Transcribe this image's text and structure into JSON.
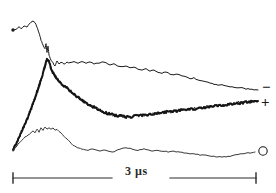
{
  "figure": {
    "background_color": "#ffffff",
    "ink_color": "#1a1a1a",
    "width": 276,
    "height": 193
  },
  "scalebar": {
    "label": "3 µs",
    "value": 3,
    "unit": "µs",
    "x_start": 13,
    "x_end": 256,
    "y": 178,
    "gap_start": 112,
    "gap_end": 170
  },
  "series_labels": {
    "minus": "−",
    "plus": "+",
    "zero": "O"
  },
  "chart_data": {
    "type": "line",
    "title": "",
    "subtitle": "",
    "xlabel": "3 µs",
    "ylabel": "",
    "grid": false,
    "legend_position": "right-inline",
    "axis_note": "no numeric axes drawn; horizontal scale bar denotes 3 microseconds",
    "xlim": [
      0,
      276
    ],
    "ylim": [
      193,
      0
    ],
    "series": [
      {
        "name": "−",
        "label": "minus",
        "stroke": "#1a1a1a",
        "stroke_width": 1,
        "noisy": false,
        "marker_start": "dot",
        "points": [
          [
            13,
            30
          ],
          [
            16,
            29
          ],
          [
            19,
            27
          ],
          [
            21,
            29
          ],
          [
            24,
            26
          ],
          [
            27,
            27
          ],
          [
            29,
            24
          ],
          [
            31,
            22
          ],
          [
            33,
            21
          ],
          [
            35,
            23
          ],
          [
            37,
            27
          ],
          [
            39,
            33
          ],
          [
            41,
            40
          ],
          [
            43,
            45
          ],
          [
            45,
            49
          ],
          [
            46,
            44
          ],
          [
            47,
            52
          ],
          [
            48,
            46
          ],
          [
            49,
            55
          ],
          [
            51,
            60
          ],
          [
            53,
            63
          ],
          [
            55,
            66
          ],
          [
            57,
            61
          ],
          [
            59,
            64
          ],
          [
            61,
            62
          ],
          [
            64,
            64
          ],
          [
            67,
            62
          ],
          [
            70,
            63
          ],
          [
            74,
            62
          ],
          [
            78,
            63
          ],
          [
            82,
            62
          ],
          [
            86,
            63
          ],
          [
            90,
            62
          ],
          [
            94,
            64
          ],
          [
            98,
            63
          ],
          [
            102,
            62
          ],
          [
            106,
            63
          ],
          [
            110,
            65
          ],
          [
            114,
            64
          ],
          [
            118,
            66
          ],
          [
            122,
            67
          ],
          [
            126,
            66
          ],
          [
            130,
            68
          ],
          [
            134,
            67
          ],
          [
            138,
            69
          ],
          [
            142,
            70
          ],
          [
            146,
            69
          ],
          [
            150,
            71
          ],
          [
            154,
            70
          ],
          [
            158,
            72
          ],
          [
            162,
            73
          ],
          [
            166,
            72
          ],
          [
            170,
            74
          ],
          [
            174,
            75
          ],
          [
            178,
            74
          ],
          [
            182,
            76
          ],
          [
            186,
            77
          ],
          [
            190,
            79
          ],
          [
            194,
            78
          ],
          [
            198,
            80
          ],
          [
            202,
            81
          ],
          [
            206,
            82
          ],
          [
            210,
            83
          ],
          [
            214,
            84
          ],
          [
            218,
            85
          ],
          [
            222,
            85
          ],
          [
            226,
            86
          ],
          [
            230,
            87
          ],
          [
            234,
            87
          ],
          [
            238,
            88
          ],
          [
            242,
            88
          ],
          [
            246,
            89
          ],
          [
            250,
            89
          ],
          [
            254,
            90
          ],
          [
            258,
            90
          ]
        ]
      },
      {
        "name": "+",
        "label": "plus",
        "stroke": "#141414",
        "stroke_width": 2,
        "noisy": true,
        "marker_start": "none",
        "points": [
          [
            13,
            150
          ],
          [
            16,
            144
          ],
          [
            19,
            138
          ],
          [
            22,
            131
          ],
          [
            25,
            124
          ],
          [
            28,
            117
          ],
          [
            31,
            109
          ],
          [
            34,
            101
          ],
          [
            37,
            92
          ],
          [
            40,
            83
          ],
          [
            43,
            73
          ],
          [
            45,
            66
          ],
          [
            47,
            59
          ],
          [
            49,
            62
          ],
          [
            51,
            68
          ],
          [
            53,
            73
          ],
          [
            55,
            76
          ],
          [
            58,
            80
          ],
          [
            61,
            83
          ],
          [
            64,
            86
          ],
          [
            67,
            88
          ],
          [
            70,
            91
          ],
          [
            73,
            93
          ],
          [
            76,
            96
          ],
          [
            79,
            98
          ],
          [
            82,
            100
          ],
          [
            85,
            102
          ],
          [
            88,
            104
          ],
          [
            91,
            106
          ],
          [
            94,
            107
          ],
          [
            97,
            109
          ],
          [
            100,
            110
          ],
          [
            103,
            112
          ],
          [
            106,
            113
          ],
          [
            110,
            114
          ],
          [
            114,
            115
          ],
          [
            118,
            116
          ],
          [
            122,
            116
          ],
          [
            126,
            117
          ],
          [
            130,
            117
          ],
          [
            134,
            116
          ],
          [
            138,
            116
          ],
          [
            142,
            115
          ],
          [
            146,
            115
          ],
          [
            150,
            114
          ],
          [
            154,
            114
          ],
          [
            158,
            113
          ],
          [
            162,
            113
          ],
          [
            166,
            112
          ],
          [
            170,
            112
          ],
          [
            174,
            111
          ],
          [
            178,
            111
          ],
          [
            182,
            110
          ],
          [
            186,
            110
          ],
          [
            190,
            109
          ],
          [
            194,
            109
          ],
          [
            198,
            108
          ],
          [
            202,
            108
          ],
          [
            206,
            107
          ],
          [
            210,
            107
          ],
          [
            214,
            106
          ],
          [
            218,
            106
          ],
          [
            222,
            105
          ],
          [
            226,
            105
          ],
          [
            230,
            104
          ],
          [
            234,
            104
          ],
          [
            238,
            103
          ],
          [
            242,
            103
          ],
          [
            246,
            102
          ],
          [
            250,
            102
          ],
          [
            254,
            101
          ],
          [
            258,
            101
          ]
        ]
      },
      {
        "name": "O",
        "label": "zero",
        "stroke": "#3a3a3a",
        "stroke_width": 1,
        "noisy": false,
        "marker_start": "none",
        "marker_end": "circle",
        "points": [
          [
            13,
            151
          ],
          [
            16,
            147
          ],
          [
            19,
            143
          ],
          [
            22,
            140
          ],
          [
            25,
            137
          ],
          [
            28,
            135
          ],
          [
            31,
            133
          ],
          [
            33,
            131
          ],
          [
            35,
            133
          ],
          [
            37,
            129
          ],
          [
            39,
            132
          ],
          [
            41,
            128
          ],
          [
            43,
            130
          ],
          [
            45,
            127
          ],
          [
            47,
            129
          ],
          [
            49,
            128
          ],
          [
            51,
            129
          ],
          [
            53,
            128
          ],
          [
            55,
            130
          ],
          [
            57,
            129
          ],
          [
            59,
            131
          ],
          [
            61,
            133
          ],
          [
            64,
            136
          ],
          [
            67,
            139
          ],
          [
            70,
            142
          ],
          [
            73,
            145
          ],
          [
            76,
            147
          ],
          [
            79,
            148
          ],
          [
            82,
            149
          ],
          [
            85,
            150
          ],
          [
            88,
            150
          ],
          [
            92,
            149
          ],
          [
            96,
            150
          ],
          [
            100,
            151
          ],
          [
            104,
            150
          ],
          [
            108,
            151
          ],
          [
            112,
            152
          ],
          [
            116,
            151
          ],
          [
            120,
            149
          ],
          [
            124,
            148
          ],
          [
            128,
            148
          ],
          [
            132,
            149
          ],
          [
            136,
            150
          ],
          [
            140,
            150
          ],
          [
            144,
            149
          ],
          [
            148,
            150
          ],
          [
            152,
            151
          ],
          [
            156,
            150
          ],
          [
            160,
            151
          ],
          [
            164,
            151
          ],
          [
            168,
            152
          ],
          [
            172,
            151
          ],
          [
            176,
            152
          ],
          [
            180,
            152
          ],
          [
            184,
            153
          ],
          [
            188,
            153
          ],
          [
            192,
            154
          ],
          [
            196,
            154
          ],
          [
            200,
            155
          ],
          [
            204,
            155
          ],
          [
            208,
            156
          ],
          [
            212,
            156
          ],
          [
            216,
            157
          ],
          [
            220,
            157
          ],
          [
            224,
            157
          ],
          [
            228,
            156
          ],
          [
            232,
            156
          ],
          [
            236,
            155
          ],
          [
            240,
            154
          ],
          [
            244,
            154
          ],
          [
            248,
            153
          ],
          [
            252,
            153
          ],
          [
            255,
            152
          ]
        ]
      }
    ]
  }
}
